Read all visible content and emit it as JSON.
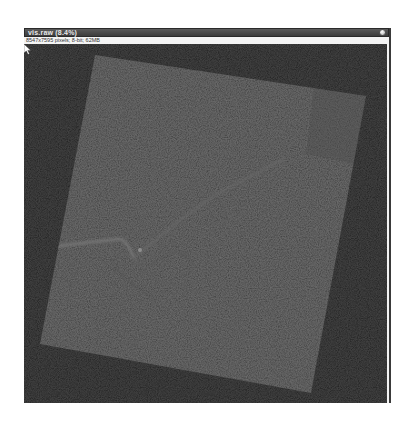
{
  "window": {
    "title": "vis.raw (8.4%)",
    "info": "8547x7595 pixels; 8-bit; 62MB",
    "close_icon": "close-circle-icon"
  },
  "image": {
    "description": "Rotated grayscale satellite raster with river features",
    "background_color": "#151515",
    "scene_color": "#3a3a3a",
    "corners": {
      "top_left": [
        95,
        55
      ],
      "top_right": [
        366,
        96
      ],
      "bottom_right": [
        311,
        393
      ],
      "bottom_left": [
        40,
        344
      ]
    }
  },
  "cursor": {
    "icon": "mouse-pointer-icon",
    "position": [
      347,
      228
    ]
  }
}
